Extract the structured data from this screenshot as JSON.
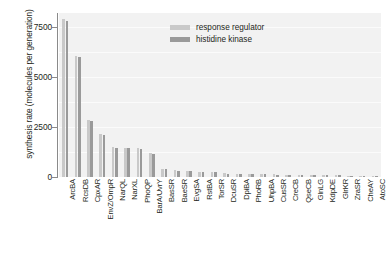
{
  "chart_data": {
    "type": "bar",
    "title": "",
    "xlabel": "",
    "ylabel": "synthesis rate (molecules per generation)",
    "ylim": [
      0,
      8200
    ],
    "yticks": [
      0,
      2500,
      5000,
      7500
    ],
    "ytick_labels": [
      "0",
      "2500",
      "5000",
      "7500"
    ],
    "grid": true,
    "legend_position": "top-right",
    "categories": [
      "ArcBA",
      "RcsDB",
      "CpxAR",
      "EnvZ/OmpR",
      "NarQL",
      "NarXL",
      "PhoQP",
      "BarA/UvrY",
      "BasSR",
      "BaeSR",
      "EvgSA",
      "RstBA",
      "TorSR",
      "DcuSR",
      "DpiBA",
      "PhoRB",
      "UhpBA",
      "CusSR",
      "CreCB",
      "QseCB",
      "GlnLG",
      "KdpDE",
      "GlrKR",
      "ZraSR",
      "CheAY",
      "AtoSC"
    ],
    "series": [
      {
        "name": "response regulator",
        "color": "#c9c9c9",
        "values": [
          7900,
          6050,
          2860,
          2160,
          1480,
          1460,
          1430,
          1180,
          420,
          330,
          300,
          270,
          250,
          180,
          170,
          160,
          140,
          130,
          120,
          110,
          100,
          95,
          85,
          75,
          65,
          55
        ]
      },
      {
        "name": "histidine kinase",
        "color": "#9a9a9a",
        "values": [
          7780,
          5980,
          2820,
          2120,
          1450,
          1440,
          1400,
          1150,
          400,
          320,
          290,
          260,
          240,
          175,
          165,
          155,
          135,
          125,
          115,
          105,
          98,
          90,
          80,
          70,
          60,
          50
        ]
      }
    ]
  },
  "legend": {
    "entries": [
      {
        "label": "response regulator",
        "color": "#c9c9c9"
      },
      {
        "label": "histidine kinase",
        "color": "#9a9a9a"
      }
    ]
  }
}
